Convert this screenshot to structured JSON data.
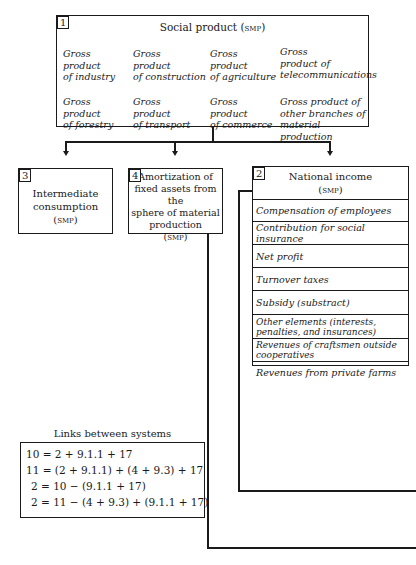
{
  "box1": {
    "number": "1",
    "title": "Social product (smp)",
    "items": [
      [
        "Gross",
        "product",
        "of industry"
      ],
      [
        "Gross",
        "product",
        "of construction"
      ],
      [
        "Gross",
        "product",
        "of agriculture"
      ],
      [
        "Gross",
        "product of",
        "telecommunications"
      ],
      [
        "Gross",
        "product",
        "of forestry"
      ],
      [
        "Gross",
        "product",
        "of transport"
      ],
      [
        "Gross",
        "product",
        "of commerce"
      ],
      [
        "Gross product of",
        "other branches of",
        "material production"
      ]
    ]
  },
  "box3": {
    "number": "3",
    "lines": [
      "Intermediate",
      "consumption",
      "(smp)"
    ]
  },
  "box4": {
    "number": "4",
    "lines": [
      "Amortization of",
      "fixed assets from the",
      "sphere of material",
      "production",
      "(smp)"
    ]
  },
  "box2": {
    "number": "2",
    "title": [
      "National income",
      "(smp)"
    ],
    "rows": [
      "Compensation of employees",
      "Contribution for social insurance",
      "Net profit",
      "Turnover taxes",
      "Subsidy  (substract)",
      "Other elements (interests, penalties, and insurances)",
      "Revenues of craftsmen outside cooperatives",
      "Revenues from private farms"
    ]
  },
  "links": {
    "title": "Links between systems",
    "equations": [
      "10 = 2 + 9.1.1 + 17",
      "11 = (2 + 9.1.1) + (4 + 9.3) + 17",
      "  2 = 10 − (9.1.1 + 17)",
      "  2 = 11 − (4 + 9.3) + (9.1.1 + 17)"
    ]
  }
}
